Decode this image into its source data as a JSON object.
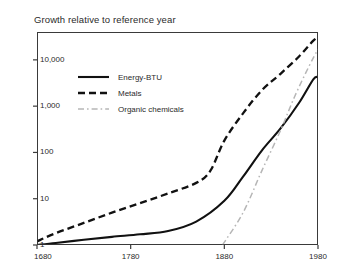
{
  "chart_data": {
    "type": "line",
    "title": "Growth relative to reference year",
    "xlabel": "",
    "ylabel": "",
    "xlim": [
      1680,
      1980
    ],
    "ylim": [
      1,
      40000
    ],
    "yscale": "log",
    "grid": false,
    "legend_position": "upper-left-inside",
    "xticks": [
      1680,
      1780,
      1880,
      1980
    ],
    "xtick_labels": [
      "1680",
      "1780",
      "1880",
      "1980"
    ],
    "yticks": [
      1,
      10,
      100,
      1000,
      10000
    ],
    "ytick_labels": [
      "1",
      "10",
      "100",
      "1,000",
      "10,000"
    ],
    "series": [
      {
        "name": "Energy-BTU",
        "style": "solid",
        "color": "#111111",
        "x": [
          1680,
          1700,
          1730,
          1760,
          1790,
          1820,
          1850,
          1880,
          1900,
          1920,
          1940,
          1960,
          1975,
          1980
        ],
        "y": [
          1.0,
          1.1,
          1.3,
          1.5,
          1.7,
          2.0,
          3.2,
          9.0,
          30,
          110,
          330,
          1200,
          3800,
          4200
        ]
      },
      {
        "name": "Metals",
        "style": "dashed",
        "color": "#111111",
        "x": [
          1680,
          1700,
          1730,
          1760,
          1790,
          1820,
          1850,
          1865,
          1880,
          1900,
          1920,
          1940,
          1960,
          1975,
          1980
        ],
        "y": [
          1.2,
          1.8,
          3.0,
          5.0,
          8.0,
          13,
          22,
          40,
          180,
          700,
          2200,
          5000,
          12000,
          26000,
          30000
        ]
      },
      {
        "name": "Organic chemicals",
        "style": "dash-dot",
        "color": "#b6b6b6",
        "x": [
          1878,
          1900,
          1920,
          1940,
          1955,
          1970,
          1980
        ],
        "y": [
          1.0,
          5.0,
          40,
          300,
          1600,
          7000,
          17000
        ]
      }
    ]
  },
  "legend": {
    "items": [
      {
        "label": "Energy-BTU",
        "style": "solid"
      },
      {
        "label": "Metals",
        "style": "dashed"
      },
      {
        "label": "Organic chemicals",
        "style": "dash-dot"
      }
    ]
  }
}
